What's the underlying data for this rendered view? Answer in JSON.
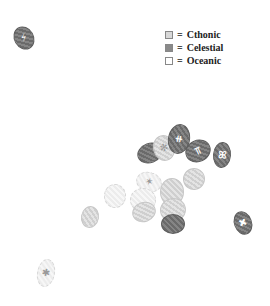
{
  "legend": {
    "items": [
      {
        "symbol": "=",
        "label": "Cthonic",
        "swatch": "#d8d8d8"
      },
      {
        "symbol": "=",
        "label": "Celestial",
        "swatch": "#8a8a8a"
      },
      {
        "symbol": "=",
        "label": "Oceanic",
        "swatch": "#ffffff"
      }
    ]
  },
  "seals": [
    {
      "cls": "celestial",
      "x": 14,
      "y": 26,
      "w": 20,
      "h": 24,
      "rot": -30,
      "mark": "⚡"
    },
    {
      "cls": "celestial",
      "x": 137,
      "y": 143,
      "w": 26,
      "h": 20,
      "rot": -20,
      "mark": ""
    },
    {
      "cls": "cthonic",
      "x": 153,
      "y": 135,
      "w": 22,
      "h": 26,
      "rot": -15,
      "mark": "✻"
    },
    {
      "cls": "celestial",
      "x": 168,
      "y": 124,
      "w": 22,
      "h": 30,
      "rot": 10,
      "mark": "⧺"
    },
    {
      "cls": "celestial",
      "x": 185,
      "y": 140,
      "w": 26,
      "h": 22,
      "rot": -25,
      "mark": "⫪"
    },
    {
      "cls": "celestial",
      "x": 213,
      "y": 142,
      "w": 18,
      "h": 26,
      "rot": 5,
      "mark": "ꕤ"
    },
    {
      "cls": "oceanic",
      "x": 136,
      "y": 172,
      "w": 26,
      "h": 20,
      "rot": 15,
      "mark": "✶"
    },
    {
      "cls": "cthonic",
      "x": 183,
      "y": 168,
      "w": 22,
      "h": 22,
      "rot": -10,
      "mark": ""
    },
    {
      "cls": "cthonic",
      "x": 160,
      "y": 178,
      "w": 24,
      "h": 28,
      "rot": 0,
      "mark": ""
    },
    {
      "cls": "oceanic",
      "x": 130,
      "y": 188,
      "w": 26,
      "h": 24,
      "rot": 0,
      "mark": ""
    },
    {
      "cls": "oceanic",
      "x": 104,
      "y": 184,
      "w": 22,
      "h": 24,
      "rot": 0,
      "mark": ""
    },
    {
      "cls": "cthonic",
      "x": 81,
      "y": 206,
      "w": 18,
      "h": 22,
      "rot": 10,
      "mark": ""
    },
    {
      "cls": "cthonic",
      "x": 132,
      "y": 202,
      "w": 24,
      "h": 20,
      "rot": -20,
      "mark": ""
    },
    {
      "cls": "cthonic",
      "x": 160,
      "y": 198,
      "w": 26,
      "h": 24,
      "rot": -10,
      "mark": ""
    },
    {
      "cls": "celestial",
      "x": 161,
      "y": 214,
      "w": 24,
      "h": 20,
      "rot": 0,
      "mark": ""
    },
    {
      "cls": "celestial",
      "x": 234,
      "y": 211,
      "w": 18,
      "h": 24,
      "rot": -20,
      "mark": "✖"
    },
    {
      "cls": "oceanic",
      "x": 37,
      "y": 259,
      "w": 18,
      "h": 28,
      "rot": 10,
      "mark": "✱"
    }
  ]
}
